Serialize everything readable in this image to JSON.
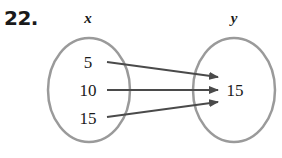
{
  "problem_number": "22.",
  "domain_set": {
    "title": "x",
    "values": [
      "5",
      "10",
      "15"
    ]
  },
  "range_set": {
    "title": "y",
    "values": [
      "15"
    ]
  },
  "mappings": [
    {
      "from": "5",
      "to": "15"
    },
    {
      "from": "10",
      "to": "15"
    },
    {
      "from": "15",
      "to": "15"
    }
  ],
  "colors": {
    "ellipse": "#9a9a9a",
    "arrow": "#4a4a4a",
    "text": "#1a1a1a"
  }
}
